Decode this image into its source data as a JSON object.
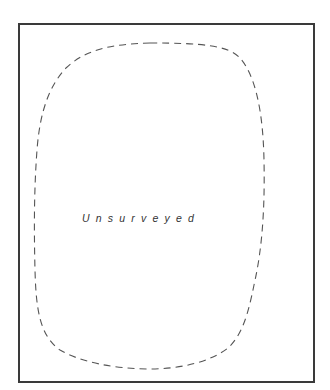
{
  "map": {
    "region_label": "Unsurveyed",
    "region_label_spaced": "U n s u r v e y e d",
    "boundary_style": "dashed",
    "colors": {
      "frame": "#3a3a3a",
      "boundary": "#555555",
      "label": "#333333",
      "background": "#ffffff"
    }
  }
}
